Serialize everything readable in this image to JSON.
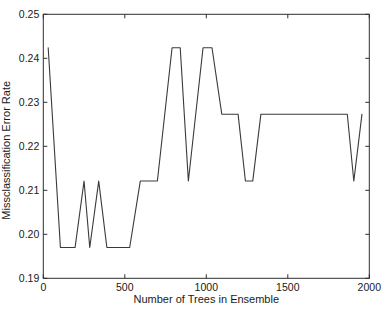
{
  "chart_data": {
    "type": "line",
    "title": "",
    "xlabel": "Number of Trees in Ensemble",
    "ylabel": "Missclassification Error Rate",
    "xlim": [
      0,
      2000
    ],
    "ylim": [
      0.19,
      0.25
    ],
    "x_ticks": [
      0,
      500,
      1000,
      1500,
      2000
    ],
    "x_tick_labels": [
      "0",
      "500",
      "1000",
      "1500",
      "2000"
    ],
    "y_ticks": [
      0.19,
      0.2,
      0.21,
      0.22,
      0.23,
      0.24,
      0.25
    ],
    "y_tick_labels": [
      "0.19",
      "0.20",
      "0.21",
      "0.22",
      "0.23",
      "0.24",
      "0.25"
    ],
    "grid": false,
    "legend": null,
    "colors": {
      "line": "#3a3a3a",
      "axis": "#2e2e2e",
      "text": "#1a1a1a",
      "background": "#ffffff"
    },
    "series": [
      {
        "name": "misclassification-error-rate",
        "points": [
          [
            30,
            0.2424
          ],
          [
            105,
            0.197
          ],
          [
            195,
            0.197
          ],
          [
            250,
            0.2121
          ],
          [
            285,
            0.197
          ],
          [
            340,
            0.2121
          ],
          [
            390,
            0.197
          ],
          [
            530,
            0.197
          ],
          [
            595,
            0.2121
          ],
          [
            700,
            0.2121
          ],
          [
            790,
            0.2424
          ],
          [
            840,
            0.2424
          ],
          [
            890,
            0.2121
          ],
          [
            980,
            0.2424
          ],
          [
            1035,
            0.2424
          ],
          [
            1095,
            0.2273
          ],
          [
            1195,
            0.2273
          ],
          [
            1240,
            0.2121
          ],
          [
            1285,
            0.2121
          ],
          [
            1335,
            0.2273
          ],
          [
            1865,
            0.2273
          ],
          [
            1905,
            0.2121
          ],
          [
            1955,
            0.2273
          ]
        ]
      }
    ]
  }
}
